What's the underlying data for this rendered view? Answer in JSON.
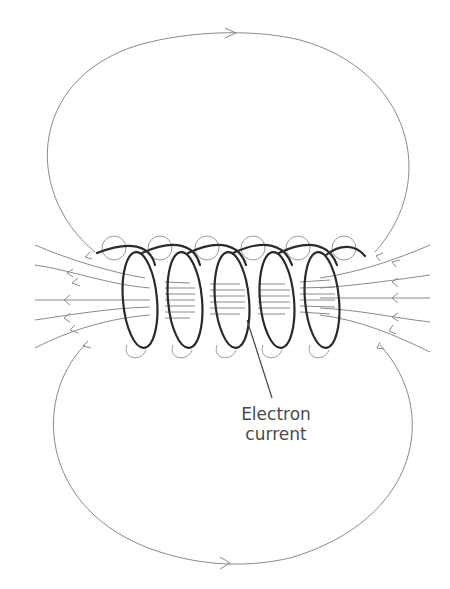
{
  "diagram": {
    "labels": {
      "electron_current_line1": "Electron",
      "electron_current_line2": "current"
    },
    "elements": {
      "outer_field_loops": 2,
      "coil_turns": 6,
      "side_field_lines_per_side": 7,
      "small_wire_loops_top": 6,
      "small_wire_loops_bottom": 5
    },
    "colors": {
      "background": "#ffffff",
      "field_line": "#8a8a8a",
      "coil": "#2a2a2a",
      "text": "#4a4a4a"
    }
  }
}
